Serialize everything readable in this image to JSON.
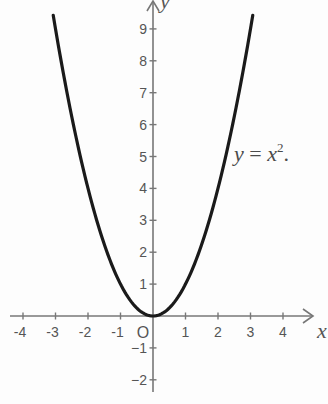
{
  "chart_data": {
    "type": "line",
    "title": "",
    "annotation": "y = x².",
    "xlabel": "x",
    "ylabel": "y",
    "origin_label": "O",
    "xlim": [
      -4.4,
      5
    ],
    "ylim": [
      -2.4,
      9.9
    ],
    "grid": false,
    "x_ticks": [
      -4,
      -3,
      -2,
      -1,
      1,
      2,
      3,
      4
    ],
    "y_ticks": [
      -2,
      -1,
      1,
      2,
      3,
      4,
      5,
      6,
      7,
      8,
      9
    ],
    "series": [
      {
        "name": "y = x^2",
        "function": "x^2",
        "x_range": [
          -3.07,
          3.07
        ],
        "x": [
          -3,
          -2,
          -1,
          0,
          1,
          2,
          3
        ],
        "y": [
          9,
          4,
          1,
          0,
          1,
          4,
          9
        ]
      }
    ]
  },
  "equation": {
    "lhs": "y",
    "eq": " = ",
    "rhs_var": "x",
    "exp": "2",
    "tail": "."
  },
  "colors": {
    "curve": "#1a1a1a",
    "axis": "#777777",
    "text": "#555555",
    "background": "#fdfdfd"
  }
}
